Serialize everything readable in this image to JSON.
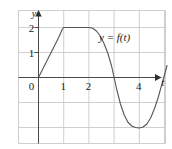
{
  "chart_data": {
    "type": "line",
    "title": "",
    "subtitle": "",
    "xlabel": "t",
    "ylabel": "y",
    "xlim": [
      -1,
      5.2
    ],
    "ylim": [
      -3,
      2.6
    ],
    "grid": true,
    "grid_spacing_x": 1,
    "grid_spacing_y": 1,
    "legend": "y = f(t)",
    "legend_position": "upper-right-inside",
    "annotations": [
      {
        "text": "y = f(t)",
        "x": 3.05,
        "y": 1.55
      }
    ],
    "xticks": [
      {
        "value": 0,
        "label": "0"
      },
      {
        "value": 1,
        "label": "1"
      },
      {
        "value": 2,
        "label": "2"
      },
      {
        "value": 4,
        "label": "4"
      }
    ],
    "yticks": [
      {
        "value": 1,
        "label": "1"
      },
      {
        "value": 2,
        "label": "2"
      }
    ],
    "series": [
      {
        "name": "f(t)",
        "color": "#555555",
        "points": [
          {
            "x": 0.0,
            "y": 0.0
          },
          {
            "x": 0.2,
            "y": 0.4
          },
          {
            "x": 0.4,
            "y": 0.8
          },
          {
            "x": 0.6,
            "y": 1.2
          },
          {
            "x": 0.8,
            "y": 1.6
          },
          {
            "x": 0.95,
            "y": 1.94
          },
          {
            "x": 1.0,
            "y": 2.0
          },
          {
            "x": 1.25,
            "y": 2.0
          },
          {
            "x": 1.5,
            "y": 2.0
          },
          {
            "x": 1.75,
            "y": 2.0
          },
          {
            "x": 2.0,
            "y": 2.0
          },
          {
            "x": 2.15,
            "y": 1.97
          },
          {
            "x": 2.3,
            "y": 1.86
          },
          {
            "x": 2.45,
            "y": 1.66
          },
          {
            "x": 2.6,
            "y": 1.36
          },
          {
            "x": 2.75,
            "y": 0.97
          },
          {
            "x": 2.9,
            "y": 0.46
          },
          {
            "x": 3.0,
            "y": 0.0
          },
          {
            "x": 3.1,
            "y": -0.46
          },
          {
            "x": 3.25,
            "y": -1.05
          },
          {
            "x": 3.4,
            "y": -1.5
          },
          {
            "x": 3.55,
            "y": -1.79
          },
          {
            "x": 3.7,
            "y": -1.94
          },
          {
            "x": 3.85,
            "y": -2.0
          },
          {
            "x": 4.0,
            "y": -2.02
          },
          {
            "x": 4.15,
            "y": -1.98
          },
          {
            "x": 4.3,
            "y": -1.86
          },
          {
            "x": 4.45,
            "y": -1.62
          },
          {
            "x": 4.6,
            "y": -1.25
          },
          {
            "x": 4.75,
            "y": -0.8
          },
          {
            "x": 4.9,
            "y": -0.25
          },
          {
            "x": 5.0,
            "y": 0.1
          },
          {
            "x": 5.1,
            "y": 0.48
          }
        ]
      }
    ],
    "axis_arrows": {
      "x_axis_arrow": true,
      "y_axis_arrow": true
    },
    "colors": {
      "grid": "#c9c9c9",
      "axis": "#4a4a4a",
      "curve": "#555555",
      "text": "#1a1a1a",
      "background": "#ffffff"
    }
  }
}
